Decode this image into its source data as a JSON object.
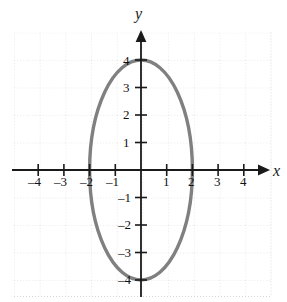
{
  "chart_data": {
    "type": "line",
    "title": "",
    "subtitle": "",
    "xlabel": "x",
    "ylabel": "y",
    "xlim": [
      -4.7,
      5.2
    ],
    "ylim": [
      -4.6,
      5.0
    ],
    "xticks": [
      -4,
      -3,
      -2,
      -1,
      1,
      2,
      3,
      4
    ],
    "yticks": [
      4,
      3,
      2,
      1,
      -1,
      -2,
      -3,
      -4
    ],
    "xtick_labels": [
      "–4",
      "–3",
      "–2",
      "–1",
      "1",
      "2",
      "3",
      "4"
    ],
    "ytick_labels": [
      "4",
      "3",
      "2",
      "1",
      "–1",
      "–2",
      "–3",
      "–4"
    ],
    "grid": true,
    "grid_style": "dotted",
    "legend": "none",
    "curve_name": "ellipse",
    "curve_description": "Ellipse centered at origin with x-intercepts at ±2 and y-intercepts at ±4",
    "center": [
      0,
      0
    ],
    "semi_axis_x": 2,
    "semi_axis_y": 4,
    "x_intercepts": [
      -2,
      2
    ],
    "y_intercepts": [
      -4,
      4
    ],
    "series": [
      {
        "name": "ellipse",
        "points": [
          [
            2.0,
            0.0
          ],
          [
            1.96,
            0.8
          ],
          [
            1.85,
            1.53
          ],
          [
            1.62,
            2.35
          ],
          [
            1.41,
            2.83
          ],
          [
            1.0,
            3.46
          ],
          [
            0.62,
            3.8
          ],
          [
            0.0,
            4.0
          ],
          [
            -0.62,
            3.8
          ],
          [
            -1.0,
            3.46
          ],
          [
            -1.41,
            2.83
          ],
          [
            -1.62,
            2.35
          ],
          [
            -1.85,
            1.53
          ],
          [
            -1.96,
            0.8
          ],
          [
            -2.0,
            0.0
          ],
          [
            -1.96,
            -0.8
          ],
          [
            -1.85,
            -1.53
          ],
          [
            -1.62,
            -2.35
          ],
          [
            -1.41,
            -2.83
          ],
          [
            -1.0,
            -3.46
          ],
          [
            -0.62,
            -3.8
          ],
          [
            0.0,
            -4.0
          ],
          [
            0.62,
            -3.8
          ],
          [
            1.0,
            -3.46
          ],
          [
            1.41,
            -2.83
          ],
          [
            1.62,
            -2.35
          ],
          [
            1.85,
            -1.53
          ],
          [
            1.96,
            -0.8
          ],
          [
            2.0,
            0.0
          ]
        ]
      }
    ]
  },
  "colors": {
    "curve": "#808080",
    "axis": "#1a1a1a",
    "grid": "#d9d9d9",
    "label": "#111111",
    "background": "#ffffff"
  },
  "axis_labels": {
    "x": "x",
    "y": "y"
  },
  "tick_text": {
    "x_neg4": "–4",
    "x_neg3": "–3",
    "x_neg2": "–2",
    "x_neg1": "–1",
    "x_1": "1",
    "x_2": "2",
    "x_3": "3",
    "x_4": "4",
    "y_4": "4",
    "y_3": "3",
    "y_2": "2",
    "y_1": "1",
    "y_neg1": "–1",
    "y_neg2": "–2",
    "y_neg3": "–3",
    "y_neg4": "–4"
  }
}
